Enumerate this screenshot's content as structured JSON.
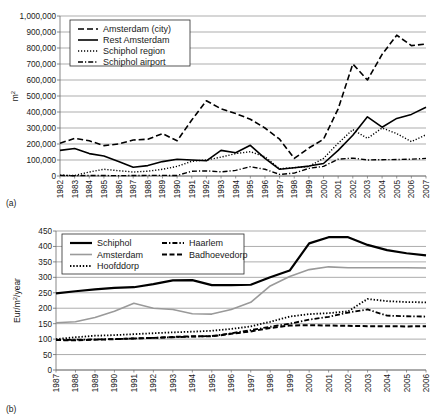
{
  "figure": {
    "panel_a_label": "(a)",
    "panel_b_label": "(b)"
  },
  "chart_data": [
    {
      "id": "a",
      "type": "line",
      "title": "",
      "xlabel": "",
      "ylabel": "m2",
      "ylabel_display": "m",
      "ylabel_sup": "2",
      "xlim": [
        1982,
        2007
      ],
      "ylim": [
        0,
        1000000
      ],
      "ytick_step": 100000,
      "grid": true,
      "legend_position": "top-left",
      "x": [
        1982,
        1983,
        1984,
        1985,
        1986,
        1987,
        1988,
        1989,
        1990,
        1991,
        1992,
        1993,
        1994,
        1995,
        1996,
        1997,
        1998,
        1999,
        2000,
        2001,
        2002,
        2003,
        2004,
        2005,
        2006,
        2007
      ],
      "xticks": [
        "1982",
        "1983",
        "1984",
        "1985",
        "1986",
        "1987",
        "1988",
        "1989",
        "1990",
        "1991",
        "1992",
        "1993",
        "1994",
        "1995",
        "1996",
        "1997",
        "1998",
        "1999",
        "2000",
        "2001",
        "2002",
        "2003",
        "2004",
        "2005",
        "2006",
        "2007"
      ],
      "yticks": [
        "0",
        "100,000",
        "200,000",
        "300,000",
        "400,000",
        "500,000",
        "600,000",
        "700,000",
        "800,000",
        "900,000",
        "1,000,000"
      ],
      "series": [
        {
          "name": "Amsterdam (city)",
          "style": "dashed",
          "color": "#000000",
          "width": 1.6,
          "dash": "6,3",
          "values": [
            205000,
            235000,
            220000,
            190000,
            200000,
            225000,
            230000,
            265000,
            220000,
            350000,
            470000,
            420000,
            390000,
            355000,
            300000,
            230000,
            110000,
            175000,
            230000,
            420000,
            700000,
            600000,
            760000,
            880000,
            815000,
            825000
          ]
        },
        {
          "name": "Rest Amsterdam",
          "style": "solid",
          "color": "#000000",
          "width": 1.6,
          "dash": "",
          "values": [
            160000,
            172000,
            140000,
            125000,
            90000,
            55000,
            65000,
            90000,
            105000,
            100000,
            95000,
            160000,
            145000,
            192000,
            110000,
            42000,
            52000,
            62000,
            78000,
            160000,
            255000,
            370000,
            305000,
            360000,
            385000,
            430000
          ]
        },
        {
          "name": "Schiphol region",
          "style": "dotted",
          "color": "#000000",
          "width": 1.4,
          "dash": "1.2,1.8",
          "values": [
            5000,
            3000,
            25000,
            42000,
            33000,
            25000,
            30000,
            42000,
            60000,
            92000,
            100000,
            118000,
            140000,
            152000,
            120000,
            45000,
            52000,
            60000,
            110000,
            205000,
            290000,
            235000,
            300000,
            265000,
            215000,
            258000
          ]
        },
        {
          "name": "Schiphol airport",
          "style": "dashdot",
          "color": "#000000",
          "width": 1.4,
          "dash": "5,2,1.2,2",
          "values": [
            4000,
            2000,
            3000,
            3000,
            2000,
            3000,
            4000,
            4000,
            3000,
            30000,
            32000,
            26000,
            35000,
            58000,
            42000,
            10000,
            18000,
            48000,
            60000,
            105000,
            112000,
            100000,
            102000,
            103000,
            105000,
            110000
          ]
        }
      ]
    },
    {
      "id": "b",
      "type": "line",
      "title": "",
      "xlabel": "",
      "ylabel": "Eur/m2/year",
      "ylabel_pre": "Eur/m",
      "ylabel_sup": "2",
      "ylabel_post": "/year",
      "xlim": [
        1987,
        2006
      ],
      "ylim": [
        0,
        450
      ],
      "ytick_step": 50,
      "grid": true,
      "legend_position": "top-left",
      "x": [
        1987,
        1988,
        1989,
        1990,
        1991,
        1992,
        1993,
        1994,
        1995,
        1996,
        1997,
        1998,
        1999,
        2000,
        2001,
        2002,
        2003,
        2004,
        2005,
        2006
      ],
      "xticks": [
        "1987",
        "1988",
        "1989",
        "1990",
        "1991",
        "1992",
        "1993",
        "1994",
        "1995",
        "1996",
        "1997",
        "1998",
        "1999",
        "2000",
        "2001",
        "2002",
        "2003",
        "2004",
        "2005",
        "2006"
      ],
      "yticks": [
        "0",
        "50",
        "100",
        "150",
        "200",
        "250",
        "300",
        "350",
        "400",
        "450"
      ],
      "series": [
        {
          "name": "Schiphol",
          "style": "solid-thick",
          "color": "#000000",
          "width": 2.2,
          "dash": "",
          "values": [
            248,
            255,
            261,
            266,
            268,
            278,
            290,
            291,
            275,
            275,
            276,
            300,
            322,
            410,
            430,
            430,
            405,
            388,
            378,
            371
          ]
        },
        {
          "name": "Amsterdam",
          "style": "solid-gray",
          "color": "#9a9a9a",
          "width": 1.6,
          "dash": "",
          "values": [
            153,
            156,
            170,
            190,
            216,
            200,
            196,
            182,
            181,
            196,
            219,
            272,
            303,
            325,
            334,
            331,
            331,
            331,
            331,
            330
          ]
        },
        {
          "name": "Hoofddorp",
          "style": "dotted",
          "color": "#000000",
          "width": 1.8,
          "dash": "1.4,1.8",
          "values": [
            100,
            106,
            111,
            113,
            116,
            119,
            122,
            124,
            127,
            133,
            141,
            156,
            173,
            181,
            184,
            190,
            230,
            223,
            220,
            219
          ]
        },
        {
          "name": "Haarlem",
          "style": "dashdot",
          "color": "#000000",
          "width": 1.8,
          "dash": "5,2,1.4,2",
          "values": [
            97,
            98,
            99,
            100,
            102,
            104,
            106,
            108,
            110,
            119,
            129,
            140,
            150,
            163,
            172,
            186,
            196,
            176,
            174,
            173
          ]
        },
        {
          "name": "Badhoevedorp",
          "style": "dashed",
          "color": "#000000",
          "width": 2.0,
          "dash": "5,2.5",
          "values": [
            97,
            96,
            98,
            100,
            102,
            104,
            107,
            109,
            109,
            117,
            125,
            136,
            144,
            145,
            144,
            143,
            142,
            142,
            141,
            142
          ]
        }
      ]
    }
  ]
}
